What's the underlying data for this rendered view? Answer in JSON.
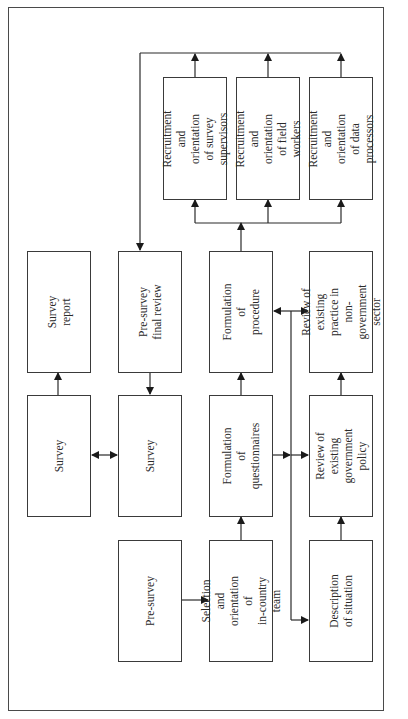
{
  "diagram": {
    "orientation": "rotated 90deg counter-clockwise (text reads bottom-to-top)",
    "nodes": {
      "survey_report": "Survey report",
      "survey_final": "Survey",
      "pre_survey_final_review": "Pre-survey final review",
      "survey": "Survey",
      "pre_survey": "Pre-survey",
      "formulation_procedure": "Formulation of\nprocedure",
      "formulation_questionnaires": "Formulation of\nquestionnaires",
      "selection_team": "Selection and\norientation of\nin-country team",
      "review_ngo": "Review of existing\npractice in\nnon-government sector",
      "review_govt": "Review of existing\ngovernment policy",
      "description_situation": "Description of situation",
      "recruit_supervisors": "Recruitment and\norientation of survey\nsupervisors",
      "recruit_field_workers": "Recruitment and\norientation of field\nworkers",
      "recruit_data_processors": "Recruitment and\norientation of data\nprocessors"
    },
    "edges": [
      {
        "from": "pre_survey",
        "to": "selection_team"
      },
      {
        "from": "selection_team",
        "to": "formulation_questionnaires"
      },
      {
        "from": "formulation_questionnaires",
        "to": "formulation_procedure"
      },
      {
        "from": "formulation_questionnaires",
        "to": "review_govt"
      },
      {
        "from": "description_situation",
        "to": "review_govt"
      },
      {
        "from": "review_govt",
        "to": "review_ngo"
      },
      {
        "from": "bus",
        "to": "formulation_procedure"
      },
      {
        "from": "bus",
        "to": "review_ngo"
      },
      {
        "from": "bus",
        "to": "description_situation"
      },
      {
        "from": "formulation_procedure",
        "to": "recruit_supervisors"
      },
      {
        "from": "formulation_procedure",
        "to": "recruit_field_workers"
      },
      {
        "from": "formulation_procedure",
        "to": "recruit_data_processors"
      },
      {
        "from": "recruit_supervisors",
        "to": "pre_survey_final_review"
      },
      {
        "from": "recruit_field_workers",
        "to": "pre_survey_final_review"
      },
      {
        "from": "recruit_data_processors",
        "to": "pre_survey_final_review"
      },
      {
        "from": "pre_survey_final_review",
        "to": "survey"
      },
      {
        "from": "survey",
        "to": "survey_final",
        "bidirectional": true
      },
      {
        "from": "survey_final",
        "to": "survey_report"
      }
    ]
  }
}
